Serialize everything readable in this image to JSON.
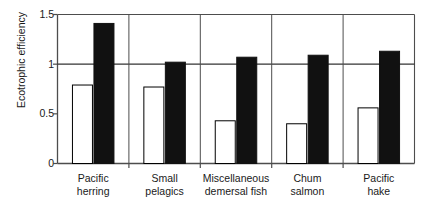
{
  "chart_data": {
    "type": "bar",
    "title": "",
    "subtitle": "",
    "xlabel": "",
    "ylabel": "Ecotrophic efficiency",
    "ylim": [
      0,
      1.5
    ],
    "yticks": [
      "0",
      "0.5",
      "1",
      "1.5"
    ],
    "ytick_values": [
      0,
      0.5,
      1,
      1.5
    ],
    "grid": "horizontal gridline at y = 1.0 only",
    "legend": "none",
    "categories": [
      "Pacific herring",
      "Small pelagics",
      "Miscellaneous demersal fish",
      "Chum salmon",
      "Pacific hake"
    ],
    "category_lines": [
      [
        "Pacific",
        "herring"
      ],
      [
        "Small",
        "pelagics"
      ],
      [
        "Miscellaneous",
        "demersal fish"
      ],
      [
        "Chum",
        "salmon"
      ],
      [
        "Pacific",
        "hake"
      ]
    ],
    "series": [
      {
        "name": "open",
        "style": "white fill, black outline",
        "color": "#ffffff",
        "edge_color": "#000000",
        "values": [
          0.79,
          0.77,
          0.43,
          0.4,
          0.56
        ]
      },
      {
        "name": "filled",
        "style": "solid black fill",
        "color": "#111111",
        "edge_color": "#111111",
        "values": [
          1.41,
          1.02,
          1.07,
          1.09,
          1.13
        ]
      }
    ],
    "annotations": {
      "reference_line": 1.0
    }
  },
  "figure": {
    "axis_color": "#4d4d4d",
    "text_color": "#1a1a1a",
    "background": "#ffffff"
  }
}
